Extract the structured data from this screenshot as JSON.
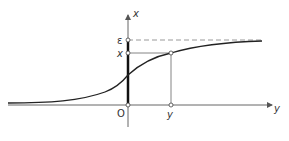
{
  "diagram": {
    "axes": {
      "vertical_label": "x",
      "horizontal_label": "y",
      "origin_label": "O"
    },
    "levels": {
      "epsilon_label": "ε",
      "x_label": "x",
      "y_label": "y"
    },
    "curve": "sigmoid rising from 0 toward asymptote ε",
    "colors": {
      "axis": "#555555",
      "curve": "#222222",
      "dashed": "#888888",
      "thick_segment": "#111111"
    }
  }
}
